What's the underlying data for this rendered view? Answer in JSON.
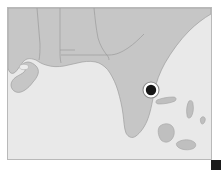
{
  "view": {
    "background_color": "#ffffff",
    "width": 221,
    "height": 170
  },
  "map": {
    "frame": {
      "x": 7,
      "y": 7,
      "width": 205,
      "height": 153,
      "border_color": "#b9b9b9"
    },
    "water_color": "#e9e9e9",
    "land_color": "#c6c6c6",
    "boundary_color": "#9b9b9b",
    "island_color": "#bfbfbf",
    "region_label": "",
    "regions": [
      {
        "name": "louisiana"
      },
      {
        "name": "mississippi"
      },
      {
        "name": "alabama"
      },
      {
        "name": "georgia"
      },
      {
        "name": "florida"
      }
    ],
    "water_bodies": [
      {
        "name": "gulf-of-mexico"
      },
      {
        "name": "atlantic-ocean"
      }
    ],
    "islands": [
      {
        "name": "island-north"
      },
      {
        "name": "island-east"
      },
      {
        "name": "island-south"
      },
      {
        "name": "island-southeast"
      },
      {
        "name": "island-small"
      }
    ],
    "marker": {
      "x": 143,
      "y": 82,
      "outer_radius": 8.0,
      "inner_radius": 5.2,
      "ring_color": "#ffffff",
      "fill_color": "#161616",
      "outline_color": "#8c8c8c",
      "label": ""
    }
  },
  "corner_marker": {
    "x": 211,
    "y": 160,
    "size": 10,
    "color": "#1b1b1b",
    "label": ""
  }
}
